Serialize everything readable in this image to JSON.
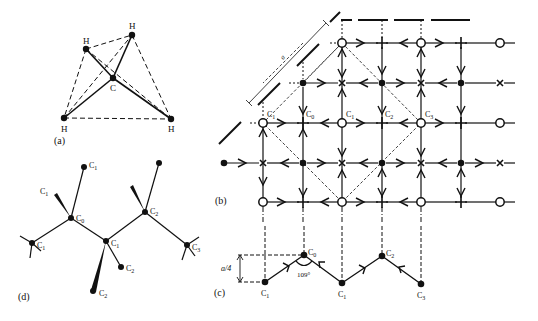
{
  "panels": {
    "a": {
      "label": "(a)",
      "atoms": [
        {
          "id": "H1",
          "label": "H",
          "x": 86,
          "y": 49
        },
        {
          "id": "H2",
          "label": "H",
          "x": 132,
          "y": 35
        },
        {
          "id": "C",
          "label": "C",
          "x": 113,
          "y": 78
        },
        {
          "id": "H3",
          "label": "H",
          "x": 64,
          "y": 118
        },
        {
          "id": "H4",
          "label": "H",
          "x": 171,
          "y": 119
        }
      ]
    },
    "b": {
      "label": "(b)",
      "lattice_param": "a",
      "node_labels": {
        "C1_left": "C",
        "C1_left_sub": "1",
        "C0": "C",
        "C0_sub": "0",
        "C1_mid": "C",
        "C1_mid_sub": "1",
        "C2": "C",
        "C2_sub": "2",
        "C3": "C",
        "C3_sub": "3"
      }
    },
    "c": {
      "label": "(c)",
      "height_label": "a/4",
      "angle_label": "109°",
      "atoms": [
        {
          "label": "C",
          "sub": "1"
        },
        {
          "label": "C",
          "sub": "0"
        },
        {
          "label": "C",
          "sub": "1"
        },
        {
          "label": "C",
          "sub": "2"
        },
        {
          "label": "C",
          "sub": "3"
        }
      ]
    },
    "d": {
      "label": "(d)",
      "atoms": [
        {
          "label": "C",
          "sub": "1"
        },
        {
          "label": "C",
          "sub": "1"
        },
        {
          "label": "C",
          "sub": "0"
        },
        {
          "label": "C",
          "sub": "1"
        },
        {
          "label": "C",
          "sub": "1"
        },
        {
          "label": "C",
          "sub": "2"
        },
        {
          "label": "C",
          "sub": "2"
        },
        {
          "label": "C",
          "sub": "2"
        },
        {
          "label": "C",
          "sub": "3"
        }
      ]
    }
  }
}
